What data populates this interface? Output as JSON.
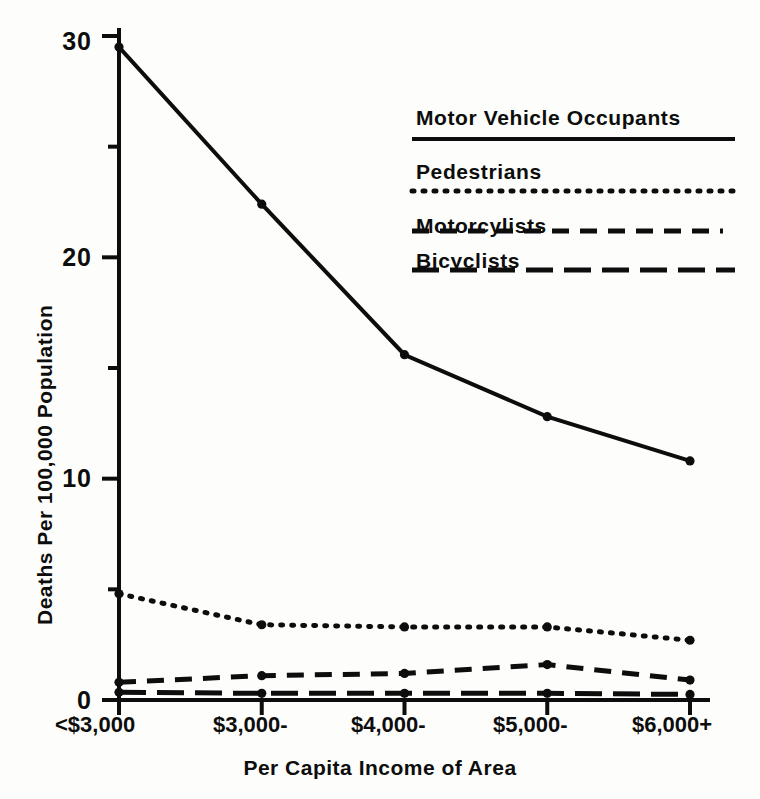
{
  "chart_data": {
    "type": "line",
    "title": "",
    "xlabel": "Per Capita Income of Area",
    "ylabel": "Deaths Per 100,000 Population",
    "categories": [
      "<$3,000",
      "$3,000-",
      "$4,000-",
      "$5,000-",
      "$6,000+"
    ],
    "ylim": [
      0,
      30
    ],
    "yticks": [
      0,
      10,
      20,
      30
    ],
    "yminorticks": [
      5,
      15,
      25
    ],
    "grid": false,
    "legend_position": "upper-right-inside",
    "series": [
      {
        "name": "Motor Vehicle Occupants",
        "style": "solid",
        "values": [
          29.5,
          22.4,
          15.6,
          12.8,
          10.8
        ]
      },
      {
        "name": "Pedestrians",
        "style": "dotted",
        "values": [
          4.8,
          3.4,
          3.3,
          3.3,
          2.7
        ]
      },
      {
        "name": "Motorcylists",
        "style": "dashed",
        "values": [
          0.8,
          1.1,
          1.2,
          1.6,
          0.9
        ]
      },
      {
        "name": "Bicyclists",
        "style": "long-dashed",
        "values": [
          0.35,
          0.3,
          0.3,
          0.3,
          0.25
        ]
      }
    ]
  },
  "axis": {
    "ytick_labels": [
      "30",
      "20",
      "10",
      "0"
    ],
    "xtick_labels": [
      "<$3,000",
      "$3,000-",
      "$4,000-",
      "$5,000-",
      "$6,000+"
    ],
    "y_title": "Deaths Per 100,000 Population",
    "x_title": "Per Capita Income of Area"
  },
  "legend": {
    "items": [
      {
        "label": "Motor Vehicle Occupants",
        "style": "solid"
      },
      {
        "label": "Pedestrians",
        "style": "dotted"
      },
      {
        "label": "Motorcylists",
        "style": "dashed"
      },
      {
        "label": "Bicyclists",
        "style": "long-dashed"
      }
    ]
  },
  "colors": {
    "ink": "#0d0d0d",
    "paper": "#fdfdfb"
  }
}
